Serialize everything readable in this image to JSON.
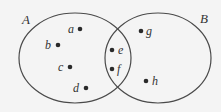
{
  "diagram": {
    "type": "venn",
    "colors": {
      "background": "#f4f4f4",
      "outline": "#4a4a4a",
      "dot": "#2a2a2a",
      "text": "#333333"
    },
    "sets": [
      {
        "id": "A",
        "label": "A",
        "cx": 75,
        "cy": 58,
        "rx": 56,
        "ry": 45,
        "label_x": 22,
        "label_y": 24
      },
      {
        "id": "B",
        "label": "B",
        "cx": 158,
        "cy": 58,
        "rx": 53,
        "ry": 45,
        "label_x": 200,
        "label_y": 23
      }
    ],
    "elements": [
      {
        "label": "a",
        "region": "A only",
        "dot_x": 80,
        "dot_y": 29,
        "label_x": 68,
        "label_y": 33,
        "side": "left"
      },
      {
        "label": "b",
        "region": "A only",
        "dot_x": 58,
        "dot_y": 45,
        "label_x": 45,
        "label_y": 49,
        "side": "left"
      },
      {
        "label": "c",
        "region": "A only",
        "dot_x": 70,
        "dot_y": 67,
        "label_x": 58,
        "label_y": 71,
        "side": "left"
      },
      {
        "label": "d",
        "region": "A only",
        "dot_x": 86,
        "dot_y": 88,
        "label_x": 73,
        "label_y": 92,
        "side": "left"
      },
      {
        "label": "e",
        "region": "A and B",
        "dot_x": 112,
        "dot_y": 50,
        "label_x": 118,
        "label_y": 54,
        "side": "right"
      },
      {
        "label": "f",
        "region": "A and B",
        "dot_x": 112,
        "dot_y": 69,
        "label_x": 117,
        "label_y": 73,
        "side": "right"
      },
      {
        "label": "g",
        "region": "B only",
        "dot_x": 141,
        "dot_y": 31,
        "label_x": 146,
        "label_y": 35,
        "side": "right"
      },
      {
        "label": "h",
        "region": "B only",
        "dot_x": 146,
        "dot_y": 81,
        "label_x": 152,
        "label_y": 85,
        "side": "right"
      }
    ]
  }
}
